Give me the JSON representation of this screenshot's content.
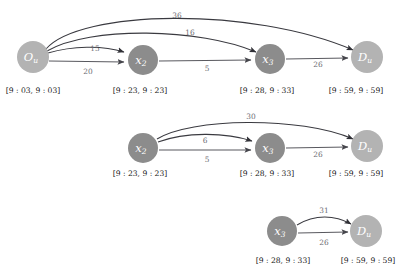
{
  "figure": {
    "type": "time-expanded-network-diagram",
    "node_fill_light": "#b3b3b3",
    "node_fill_dark": "#8c8c8c",
    "edge_color": "#59595f",
    "arc_color": "#3a3a40",
    "edge_label_color": "#6e6e74",
    "window_label_color": "#1a1a1a",
    "background": "#ffffff"
  },
  "rows": [
    {
      "id": "row-1",
      "nodes": [
        {
          "id": "n1-origin",
          "base": "O",
          "sub": "u",
          "shade": "light",
          "cx": 33,
          "cy": 57,
          "r": 16
        },
        {
          "id": "n1-x2",
          "base": "x",
          "sub": "2",
          "shade": "dark",
          "cx": 143,
          "cy": 60,
          "r": 15
        },
        {
          "id": "n1-x3",
          "base": "x",
          "sub": "3",
          "shade": "dark",
          "cx": 270,
          "cy": 59,
          "r": 15
        },
        {
          "id": "n1-dest",
          "base": "D",
          "sub": "u",
          "shade": "light",
          "cx": 367,
          "cy": 57,
          "r": 16
        }
      ],
      "edges": [
        {
          "id": "e1-o-x2-straight",
          "label": "20",
          "label_x": 88,
          "label_y": 72
        },
        {
          "id": "e1-o-x2-arc",
          "label": "15",
          "label_x": 95,
          "label_y": 49
        },
        {
          "id": "e1-o-x3-arc",
          "label": "16",
          "label_x": 190,
          "label_y": 33
        },
        {
          "id": "e1-o-d-arc",
          "label": "36",
          "label_x": 177,
          "label_y": 16
        },
        {
          "id": "e1-x2-x3",
          "label": "5",
          "label_x": 207,
          "label_y": 69
        },
        {
          "id": "e1-x3-d",
          "label": "26",
          "label_x": 318,
          "label_y": 65
        }
      ],
      "windows": [
        {
          "id": "w1-origin",
          "text": "[9 : 03, 9 : 03]",
          "x": 33,
          "y": 91
        },
        {
          "id": "w1-x2",
          "text": "[9 : 23, 9 : 23]",
          "x": 140,
          "y": 91
        },
        {
          "id": "w1-x3",
          "text": "[9 : 28, 9 : 33]",
          "x": 267,
          "y": 91
        },
        {
          "id": "w1-dest",
          "text": "[9 : 59, 9 : 59]",
          "x": 356,
          "y": 91
        }
      ]
    },
    {
      "id": "row-2",
      "nodes": [
        {
          "id": "n2-x2",
          "base": "x",
          "sub": "2",
          "shade": "dark",
          "cx": 143,
          "cy": 148,
          "r": 15
        },
        {
          "id": "n2-x3",
          "base": "x",
          "sub": "3",
          "shade": "dark",
          "cx": 270,
          "cy": 148,
          "r": 15
        },
        {
          "id": "n2-dest",
          "base": "D",
          "sub": "u",
          "shade": "light",
          "cx": 367,
          "cy": 146,
          "r": 16
        }
      ],
      "edges": [
        {
          "id": "e2-x2-x3-straight",
          "label": "5",
          "label_x": 207,
          "label_y": 160
        },
        {
          "id": "e2-x2-x3-arc",
          "label": "6",
          "label_x": 205,
          "label_y": 141
        },
        {
          "id": "e2-x2-d-arc",
          "label": "30",
          "label_x": 251,
          "label_y": 117
        },
        {
          "id": "e2-x3-d",
          "label": "26",
          "label_x": 318,
          "label_y": 155
        }
      ],
      "windows": [
        {
          "id": "w2-x2",
          "text": "[9 : 23, 9 : 23]",
          "x": 140,
          "y": 174
        },
        {
          "id": "w2-x3",
          "text": "[9 : 28, 9 : 33]",
          "x": 267,
          "y": 174
        },
        {
          "id": "w2-dest",
          "text": "[9 : 59, 9 : 59]",
          "x": 356,
          "y": 174
        }
      ]
    },
    {
      "id": "row-3",
      "nodes": [
        {
          "id": "n3-x3",
          "base": "x",
          "sub": "3",
          "shade": "dark",
          "cx": 282,
          "cy": 231,
          "r": 15
        },
        {
          "id": "n3-dest",
          "base": "D",
          "sub": "u",
          "shade": "light",
          "cx": 366,
          "cy": 231,
          "r": 16
        }
      ],
      "edges": [
        {
          "id": "e3-x3-d-straight",
          "label": "26",
          "label_x": 324,
          "label_y": 243
        },
        {
          "id": "e3-x3-d-arc",
          "label": "31",
          "label_x": 324,
          "label_y": 211
        }
      ],
      "windows": [
        {
          "id": "w3-x3",
          "text": "[9 : 28, 9 : 33]",
          "x": 283,
          "y": 261
        },
        {
          "id": "w3-dest",
          "text": "[9 : 59, 9 : 59]",
          "x": 368,
          "y": 261
        }
      ]
    }
  ]
}
